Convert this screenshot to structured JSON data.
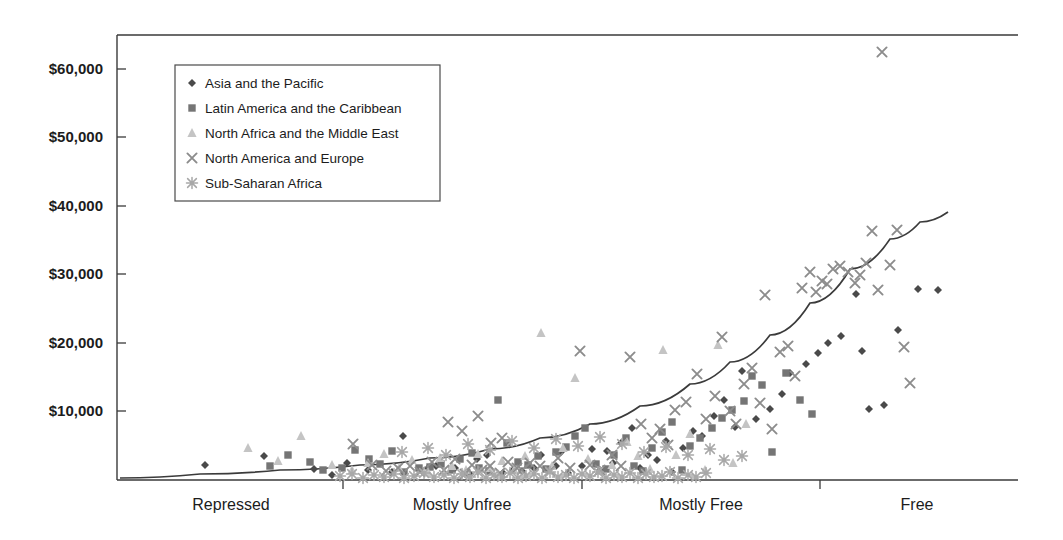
{
  "chart_data": {
    "type": "scatter",
    "title": "",
    "subtitle": "",
    "xlabel": "",
    "ylabel": "",
    "grid": false,
    "legend_position": "top-left",
    "x_axis": {
      "tick_labels": [
        "Repressed",
        "Mostly Unfree",
        "Mostly Free",
        "Free"
      ],
      "tick_label_positions_px": [
        231,
        462,
        701,
        917
      ],
      "tick_mark_positions_px": [
        343,
        582,
        820
      ],
      "range_px": [
        117,
        1018
      ]
    },
    "y_axis": {
      "tick_labels": [
        "$10,000",
        "$20,000",
        "$30,000",
        "$40,000",
        "$50,000",
        "$60,000"
      ],
      "tick_values": [
        10000,
        20000,
        30000,
        40000,
        50000,
        60000
      ],
      "ylim": [
        0,
        65000
      ],
      "tick_positions_px": [
        411,
        343,
        274,
        206,
        137,
        69
      ],
      "baseline_px": 480
    },
    "legend": [
      {
        "label": "Asia and the Pacific",
        "marker": "diamond",
        "color": "#4a4a4a"
      },
      {
        "label": "Latin America and the Caribbean",
        "marker": "square",
        "color": "#757575"
      },
      {
        "label": "North Africa and the Middle East",
        "marker": "triangle",
        "color": "#c4c4c4"
      },
      {
        "label": "North America and Europe",
        "marker": "cross",
        "color": "#8c8c8c"
      },
      {
        "label": "Sub-Saharan Africa",
        "marker": "asterisk",
        "color": "#a8a8a8"
      }
    ],
    "trend_line": {
      "description": "exponential fit",
      "color": "#3b3b3b",
      "points_px": [
        [
          120,
          478
        ],
        [
          200,
          474
        ],
        [
          280,
          470
        ],
        [
          360,
          465
        ],
        [
          430,
          458
        ],
        [
          490,
          449
        ],
        [
          540,
          438
        ],
        [
          590,
          424
        ],
        [
          640,
          406
        ],
        [
          690,
          384
        ],
        [
          730,
          362
        ],
        [
          770,
          335
        ],
        [
          810,
          303
        ],
        [
          850,
          269
        ],
        [
          890,
          239
        ],
        [
          920,
          222
        ],
        [
          948,
          212
        ]
      ]
    },
    "series": [
      {
        "name": "Asia and the Pacific",
        "marker": "diamond",
        "color": "#4a4a4a",
        "points_px": [
          [
            205,
            465
          ],
          [
            264,
            456
          ],
          [
            314,
            469
          ],
          [
            332,
            475
          ],
          [
            347,
            463
          ],
          [
            368,
            470
          ],
          [
            392,
            472
          ],
          [
            403,
            436
          ],
          [
            428,
            468
          ],
          [
            436,
            466
          ],
          [
            455,
            468
          ],
          [
            470,
            474
          ],
          [
            477,
            459
          ],
          [
            487,
            455
          ],
          [
            503,
            473
          ],
          [
            513,
            470
          ],
          [
            522,
            471
          ],
          [
            534,
            468
          ],
          [
            541,
            455
          ],
          [
            556,
            466
          ],
          [
            561,
            452
          ],
          [
            568,
            473
          ],
          [
            582,
            466
          ],
          [
            592,
            449
          ],
          [
            600,
            470
          ],
          [
            607,
            451
          ],
          [
            613,
            463
          ],
          [
            621,
            443
          ],
          [
            632,
            428
          ],
          [
            640,
            468
          ],
          [
            648,
            455
          ],
          [
            657,
            460
          ],
          [
            666,
            441
          ],
          [
            672,
            472
          ],
          [
            683,
            448
          ],
          [
            693,
            431
          ],
          [
            702,
            436
          ],
          [
            714,
            416
          ],
          [
            724,
            400
          ],
          [
            735,
            427
          ],
          [
            742,
            371
          ],
          [
            756,
            419
          ],
          [
            770,
            409
          ],
          [
            782,
            394
          ],
          [
            790,
            373
          ],
          [
            806,
            364
          ],
          [
            818,
            353
          ],
          [
            828,
            343
          ],
          [
            841,
            336
          ],
          [
            856,
            294
          ],
          [
            862,
            351
          ],
          [
            869,
            409
          ],
          [
            884,
            405
          ],
          [
            898,
            330
          ],
          [
            918,
            289
          ],
          [
            938,
            290
          ]
        ]
      },
      {
        "name": "Latin America and the Caribbean",
        "marker": "square",
        "color": "#757575",
        "points_px": [
          [
            270,
            466
          ],
          [
            288,
            455
          ],
          [
            310,
            462
          ],
          [
            323,
            470
          ],
          [
            342,
            468
          ],
          [
            355,
            450
          ],
          [
            369,
            459
          ],
          [
            380,
            464
          ],
          [
            392,
            451
          ],
          [
            404,
            472
          ],
          [
            419,
            468
          ],
          [
            430,
            467
          ],
          [
            441,
            464
          ],
          [
            452,
            470
          ],
          [
            460,
            459
          ],
          [
            472,
            453
          ],
          [
            479,
            468
          ],
          [
            489,
            471
          ],
          [
            498,
            400
          ],
          [
            507,
            443
          ],
          [
            518,
            462
          ],
          [
            528,
            465
          ],
          [
            538,
            456
          ],
          [
            546,
            469
          ],
          [
            556,
            452
          ],
          [
            566,
            447
          ],
          [
            575,
            436
          ],
          [
            585,
            428
          ],
          [
            596,
            464
          ],
          [
            606,
            469
          ],
          [
            614,
            455
          ],
          [
            626,
            438
          ],
          [
            634,
            466
          ],
          [
            643,
            471
          ],
          [
            652,
            448
          ],
          [
            662,
            432
          ],
          [
            672,
            422
          ],
          [
            682,
            470
          ],
          [
            690,
            446
          ],
          [
            700,
            438
          ],
          [
            712,
            428
          ],
          [
            722,
            418
          ],
          [
            732,
            410
          ],
          [
            744,
            401
          ],
          [
            752,
            376
          ],
          [
            762,
            385
          ],
          [
            772,
            452
          ],
          [
            786,
            373
          ],
          [
            800,
            400
          ],
          [
            812,
            414
          ]
        ]
      },
      {
        "name": "North Africa and the Middle East",
        "marker": "triangle",
        "color": "#c4c4c4",
        "points_px": [
          [
            248,
            448
          ],
          [
            278,
            461
          ],
          [
            301,
            436
          ],
          [
            332,
            465
          ],
          [
            352,
            470
          ],
          [
            368,
            463
          ],
          [
            384,
            454
          ],
          [
            399,
            468
          ],
          [
            412,
            460
          ],
          [
            428,
            472
          ],
          [
            440,
            458
          ],
          [
            452,
            466
          ],
          [
            466,
            470
          ],
          [
            478,
            454
          ],
          [
            490,
            468
          ],
          [
            502,
            461
          ],
          [
            514,
            470
          ],
          [
            525,
            456
          ],
          [
            541,
            333
          ],
          [
            552,
            466
          ],
          [
            563,
            448
          ],
          [
            575,
            378
          ],
          [
            588,
            459
          ],
          [
            600,
            471
          ],
          [
            612,
            465
          ],
          [
            627,
            442
          ],
          [
            638,
            456
          ],
          [
            650,
            469
          ],
          [
            663,
            350
          ],
          [
            676,
            455
          ],
          [
            690,
            434
          ],
          [
            705,
            470
          ],
          [
            718,
            345
          ],
          [
            733,
            463
          ],
          [
            746,
            424
          ]
        ]
      },
      {
        "name": "North America and Europe",
        "marker": "cross",
        "color": "#8c8c8c",
        "points_px": [
          [
            353,
            444
          ],
          [
            372,
            465
          ],
          [
            386,
            471
          ],
          [
            398,
            468
          ],
          [
            410,
            466
          ],
          [
            420,
            472
          ],
          [
            432,
            462
          ],
          [
            444,
            470
          ],
          [
            455,
            459
          ],
          [
            465,
            474
          ],
          [
            472,
            465
          ],
          [
            482,
            470
          ],
          [
            490,
            466
          ],
          [
            500,
            473
          ],
          [
            508,
            462
          ],
          [
            517,
            468
          ],
          [
            448,
            422
          ],
          [
            462,
            431
          ],
          [
            478,
            416
          ],
          [
            491,
            443
          ],
          [
            502,
            438
          ],
          [
            522,
            470
          ],
          [
            530,
            463
          ],
          [
            540,
            466
          ],
          [
            550,
            471
          ],
          [
            558,
            458
          ],
          [
            570,
            468
          ],
          [
            580,
            351
          ],
          [
            590,
            465
          ],
          [
            600,
            470
          ],
          [
            612,
            455
          ],
          [
            621,
            466
          ],
          [
            630,
            357
          ],
          [
            641,
            424
          ],
          [
            652,
            438
          ],
          [
            660,
            429
          ],
          [
            668,
            445
          ],
          [
            675,
            410
          ],
          [
            686,
            402
          ],
          [
            697,
            374
          ],
          [
            706,
            419
          ],
          [
            715,
            396
          ],
          [
            722,
            337
          ],
          [
            730,
            411
          ],
          [
            736,
            424
          ],
          [
            744,
            384
          ],
          [
            752,
            368
          ],
          [
            760,
            403
          ],
          [
            765,
            295
          ],
          [
            772,
            429
          ],
          [
            780,
            352
          ],
          [
            788,
            346
          ],
          [
            795,
            376
          ],
          [
            802,
            288
          ],
          [
            810,
            272
          ],
          [
            816,
            292
          ],
          [
            822,
            281
          ],
          [
            827,
            284
          ],
          [
            833,
            269
          ],
          [
            840,
            266
          ],
          [
            848,
            272
          ],
          [
            855,
            283
          ],
          [
            860,
            275
          ],
          [
            866,
            263
          ],
          [
            872,
            231
          ],
          [
            878,
            290
          ],
          [
            882,
            52
          ],
          [
            890,
            265
          ],
          [
            897,
            230
          ],
          [
            904,
            347
          ],
          [
            910,
            383
          ]
        ]
      },
      {
        "name": "Sub-Saharan Africa",
        "marker": "asterisk",
        "color": "#a8a8a8",
        "points_px": [
          [
            340,
            476
          ],
          [
            352,
            474
          ],
          [
            363,
            478
          ],
          [
            374,
            475
          ],
          [
            384,
            477
          ],
          [
            394,
            474
          ],
          [
            404,
            478
          ],
          [
            414,
            476
          ],
          [
            424,
            473
          ],
          [
            434,
            477
          ],
          [
            444,
            475
          ],
          [
            454,
            478
          ],
          [
            462,
            474
          ],
          [
            470,
            477
          ],
          [
            478,
            472
          ],
          [
            486,
            478
          ],
          [
            494,
            475
          ],
          [
            502,
            477
          ],
          [
            510,
            473
          ],
          [
            518,
            478
          ],
          [
            526,
            476
          ],
          [
            534,
            474
          ],
          [
            542,
            478
          ],
          [
            550,
            472
          ],
          [
            558,
            477
          ],
          [
            566,
            475
          ],
          [
            574,
            478
          ],
          [
            582,
            474
          ],
          [
            590,
            476
          ],
          [
            598,
            472
          ],
          [
            606,
            478
          ],
          [
            614,
            475
          ],
          [
            622,
            477
          ],
          [
            630,
            473
          ],
          [
            638,
            478
          ],
          [
            646,
            474
          ],
          [
            654,
            477
          ],
          [
            662,
            476
          ],
          [
            670,
            472
          ],
          [
            678,
            478
          ],
          [
            688,
            475
          ],
          [
            696,
            477
          ],
          [
            706,
            473
          ],
          [
            402,
            452
          ],
          [
            428,
            448
          ],
          [
            446,
            455
          ],
          [
            468,
            444
          ],
          [
            490,
            450
          ],
          [
            512,
            441
          ],
          [
            534,
            448
          ],
          [
            556,
            439
          ],
          [
            578,
            446
          ],
          [
            600,
            437
          ],
          [
            622,
            444
          ],
          [
            644,
            452
          ],
          [
            666,
            447
          ],
          [
            688,
            455
          ],
          [
            710,
            449
          ],
          [
            724,
            460
          ],
          [
            742,
            456
          ]
        ]
      }
    ]
  }
}
